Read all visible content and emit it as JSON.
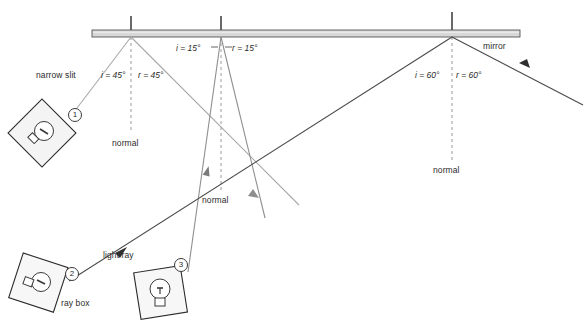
{
  "figure": {
    "background_color": "#ffffff",
    "mirror": {
      "label": "mirror",
      "fill_color": "#d8d8d8",
      "edge_color": "#555555",
      "x1": 92,
      "x2": 520,
      "y": 31,
      "thickness": 7
    },
    "normals": [
      {
        "label": "normal",
        "x": 131,
        "mirror_y": 34,
        "bottom_y": 133,
        "label_x": 112,
        "label_y": 138
      },
      {
        "label": "normal",
        "x": 221,
        "mirror_y": 34,
        "bottom_y": 190,
        "label_x": 202,
        "label_y": 195
      },
      {
        "label": "normal",
        "x": 452,
        "mirror_y": 34,
        "bottom_y": 160,
        "label_x": 433,
        "label_y": 165
      }
    ],
    "angles": [
      {
        "incident_label": "i = 45°",
        "reflected_label": "r = 45°",
        "i_x": 101,
        "i_y": 70,
        "r_x": 138,
        "r_y": 70
      },
      {
        "incident_label": "i = 15°",
        "reflected_label": "r = 15°",
        "i_x": 176,
        "i_y": 50,
        "r_x": 228,
        "r_y": 50
      },
      {
        "incident_label": "i = 60°",
        "reflected_label": "r = 60°",
        "i_x": 415,
        "i_y": 71,
        "r_x": 456,
        "r_y": 71
      }
    ],
    "annotations": [
      {
        "name": "narrow-slit-label",
        "text": "narrow slit",
        "x": 36,
        "y": 70
      },
      {
        "name": "light-ray-label",
        "text": "light ray",
        "x": 103,
        "y": 250
      },
      {
        "name": "ray-box-label",
        "text": "ray box",
        "x": 61,
        "y": 298
      }
    ],
    "ray_boxes": [
      {
        "id": 1,
        "badge": "1",
        "badge_x": 68,
        "badge_y": 108,
        "cx": 42,
        "cy": 133,
        "size": 48,
        "rotation": 45
      },
      {
        "id": 2,
        "badge": "2",
        "badge_x": 65,
        "badge_y": 270,
        "cx": 38,
        "cy": 282,
        "size": 47,
        "rotation": 20
      },
      {
        "id": 3,
        "badge": "3",
        "badge_x": 174,
        "badge_y": 262,
        "cx": 158,
        "cy": 292,
        "size": 47,
        "rotation": -10
      }
    ],
    "rays": [
      {
        "name": "ray-1-incident",
        "color": "#a9a9a9",
        "from": [
          74,
          112
        ],
        "to": [
          131,
          34
        ]
      },
      {
        "name": "ray-1-reflected",
        "color": "#a9a9a9",
        "from": [
          131,
          34
        ],
        "to": [
          262,
          214
        ]
      },
      {
        "name": "ray-3-incident",
        "color": "#8f8f8f",
        "from": [
          186,
          275
        ],
        "to": [
          221,
          34
        ]
      },
      {
        "name": "ray-3-reflected",
        "color": "#8f8f8f",
        "from": [
          221,
          34
        ],
        "to": [
          259,
          205
        ]
      },
      {
        "name": "ray-2-incident",
        "color": "#4a4a4a",
        "from": [
          69,
          281
        ],
        "to": [
          452,
          34
        ]
      },
      {
        "name": "ray-2-reflected",
        "color": "#4a4a4a",
        "from": [
          452,
          34
        ],
        "to": [
          583,
          103
        ]
      }
    ],
    "colors": {
      "ray_light": "#a9a9a9",
      "ray_mid": "#8f8f8f",
      "ray_dark": "#4a4a4a",
      "text": "#2b2b2b",
      "normal_dashed": "#9a9a9a",
      "normal_solid": "#1a1a1a"
    }
  }
}
